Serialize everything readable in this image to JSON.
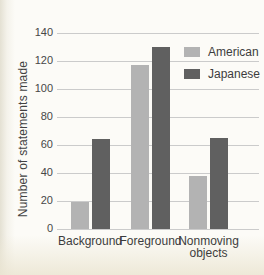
{
  "chart_data": {
    "type": "bar",
    "categories": [
      "Background",
      "Foreground",
      "Nonmoving objects"
    ],
    "series": [
      {
        "name": "American",
        "color": "#b3b3b3",
        "values": [
          19,
          117,
          38
        ]
      },
      {
        "name": "Japanese",
        "color": "#606060",
        "values": [
          64,
          130,
          65
        ]
      }
    ],
    "title": "",
    "xlabel": "",
    "ylabel": "Number of statements made",
    "ylim": [
      0,
      140
    ],
    "yticks": [
      0,
      20,
      40,
      60,
      80,
      100,
      120,
      140
    ],
    "grid": true,
    "gridline_color": "#cbcbcb",
    "legend_position": "top-right"
  }
}
